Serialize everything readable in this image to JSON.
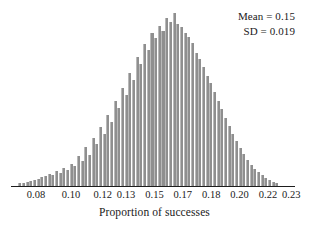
{
  "chart_data": {
    "type": "bar",
    "title": "",
    "xlabel": "Proportion of successes",
    "ylabel": "",
    "grid": false,
    "legend": "none",
    "xlim": [
      0.065,
      0.237
    ],
    "ylim": [
      0,
      0.0345
    ],
    "tick_labels": [
      "0.08",
      "0.10",
      "0.12",
      "0.13",
      "0.15",
      "0.17",
      "0.18",
      "0.20",
      "0.22",
      "0.23"
    ],
    "tick_values": [
      0.08,
      0.101,
      0.12,
      0.134,
      0.151,
      0.168,
      0.185,
      0.202,
      0.219,
      0.233
    ],
    "annotations": [
      "Mean = 0.15",
      "SD = 0.019"
    ],
    "bar_color": "#8f8f8f",
    "axis_color": "#1d1d1d",
    "x": [
      0.07,
      0.0722,
      0.0744,
      0.0766,
      0.0788,
      0.081,
      0.0832,
      0.0854,
      0.0876,
      0.0898,
      0.092,
      0.0942,
      0.0964,
      0.0986,
      0.1008,
      0.103,
      0.1052,
      0.1074,
      0.1096,
      0.1118,
      0.114,
      0.1162,
      0.1184,
      0.1206,
      0.1228,
      0.125,
      0.1272,
      0.1294,
      0.1316,
      0.1338,
      0.136,
      0.1382,
      0.1404,
      0.1426,
      0.1448,
      0.147,
      0.1492,
      0.1514,
      0.1536,
      0.1558,
      0.158,
      0.1602,
      0.1624,
      0.1646,
      0.1668,
      0.169,
      0.1712,
      0.1734,
      0.1756,
      0.1778,
      0.18,
      0.1822,
      0.1844,
      0.1866,
      0.1888,
      0.191,
      0.1932,
      0.1954,
      0.1976,
      0.1998,
      0.202,
      0.2042,
      0.2064,
      0.2086,
      0.2108,
      0.213,
      0.2152,
      0.2174,
      0.2196,
      0.2218,
      0.224
    ],
    "values": [
      0.0006,
      0.0007,
      0.0008,
      0.001,
      0.0012,
      0.0014,
      0.0017,
      0.002,
      0.0024,
      0.0022,
      0.003,
      0.0026,
      0.0036,
      0.0031,
      0.0044,
      0.0039,
      0.006,
      0.0049,
      0.0078,
      0.0062,
      0.0095,
      0.0084,
      0.0118,
      0.0104,
      0.0142,
      0.0128,
      0.017,
      0.0155,
      0.0196,
      0.0181,
      0.0225,
      0.0212,
      0.0258,
      0.0243,
      0.0284,
      0.0272,
      0.0305,
      0.0295,
      0.032,
      0.031,
      0.0335,
      0.0328,
      0.0345,
      0.0324,
      0.0318,
      0.0306,
      0.0298,
      0.0285,
      0.0266,
      0.0254,
      0.0238,
      0.022,
      0.0206,
      0.0188,
      0.017,
      0.0154,
      0.0136,
      0.012,
      0.0104,
      0.009,
      0.0076,
      0.0064,
      0.0052,
      0.0042,
      0.0034,
      0.0027,
      0.0021,
      0.0016,
      0.0012,
      0.0009,
      0.0007
    ]
  }
}
